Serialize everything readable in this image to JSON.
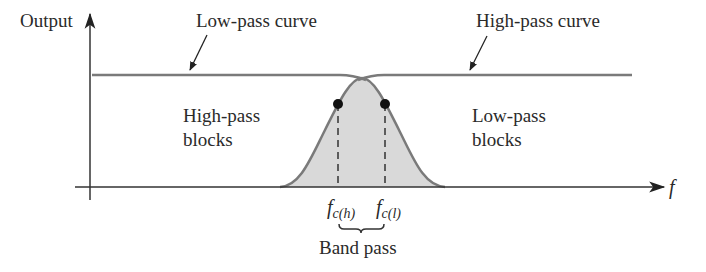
{
  "diagram": {
    "type": "band-pass filter response (low-pass + high-pass combination)",
    "axes": {
      "y_label": "Output",
      "x_label": "f"
    },
    "curves": [
      {
        "name": "Low-pass curve",
        "label": "Low-pass curve"
      },
      {
        "name": "High-pass curve",
        "label": "High-pass curve"
      }
    ],
    "regions": {
      "left": [
        "High-pass",
        "blocks"
      ],
      "right": [
        "Low-pass",
        "blocks"
      ]
    },
    "cutoffs": {
      "high": {
        "base": "f",
        "sub": "c(h)"
      },
      "low": {
        "base": "f",
        "sub": "c(l)"
      }
    },
    "band_label": "Band pass",
    "colors": {
      "curve": "#7a7a7a",
      "shade": "#d9d9d9",
      "axis": "#333333",
      "text": "#2a2a2a"
    }
  }
}
